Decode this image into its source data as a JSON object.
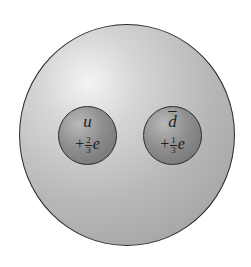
{
  "diagram": {
    "outer_particle": {
      "shape": "sphere",
      "color": "#b8b8b8"
    },
    "quarks": [
      {
        "symbol": "u",
        "antiparticle": false,
        "charge_sign": "+",
        "charge_num": "2",
        "charge_den": "3",
        "charge_unit": "e"
      },
      {
        "symbol": "d",
        "antiparticle": true,
        "charge_sign": "+",
        "charge_num": "1",
        "charge_den": "3",
        "charge_unit": "e"
      }
    ]
  }
}
